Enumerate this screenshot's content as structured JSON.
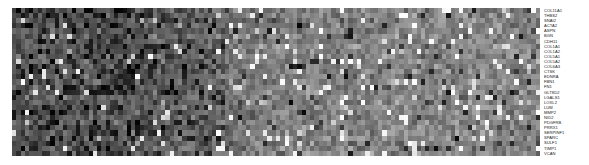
{
  "figure": {
    "type": "gene-expression-heatmap",
    "colormap": "grayscale",
    "background_color": "#ffffff"
  },
  "chart_data": {
    "type": "heatmap",
    "title": "",
    "subtitle": "",
    "xlabel": "",
    "ylabel": "",
    "grid": false,
    "legend_position": "none",
    "colormap": "grayscale",
    "value_range": [
      0,
      1
    ],
    "low_color": "#000000",
    "high_color": "#ffffff",
    "mid_color": "#808080",
    "n_rows": 29,
    "n_cols": 124,
    "x_tick_labels": [],
    "row_labels": [
      "COL11A1",
      "THBS2",
      "SNAI2",
      "ACTA2",
      "ASPN",
      "BGN",
      "CDH11",
      "COL1A1",
      "COL1A2",
      "COL5A1",
      "COL5A2",
      "COL6A3",
      "CTSK",
      "EDNRA",
      "FBN1",
      "FN1",
      "GLT8D2",
      "LGALS1",
      "LOXL2",
      "LUM",
      "MMP2",
      "NID2",
      "PDGFRB",
      "PRRX1",
      "SERPINF1",
      "SPARC",
      "SULF1",
      "TIMP1",
      "VCAN"
    ],
    "column_group_profile": {
      "description": "Left block of samples shows low expression (dark); right block shows moderate-to-high expression (mid grey with scattered bright cells)",
      "left_block_cols": [
        0,
        49
      ],
      "left_block_mean": 0.28,
      "right_block_cols": [
        50,
        123
      ],
      "right_block_mean": 0.55
    },
    "row_mean_values": [
      0.4,
      0.44,
      0.46,
      0.43,
      0.41,
      0.47,
      0.45,
      0.46,
      0.47,
      0.46,
      0.46,
      0.45,
      0.42,
      0.44,
      0.46,
      0.47,
      0.41,
      0.48,
      0.45,
      0.43,
      0.47,
      0.44,
      0.45,
      0.46,
      0.47,
      0.48,
      0.42,
      0.46,
      0.45
    ]
  }
}
